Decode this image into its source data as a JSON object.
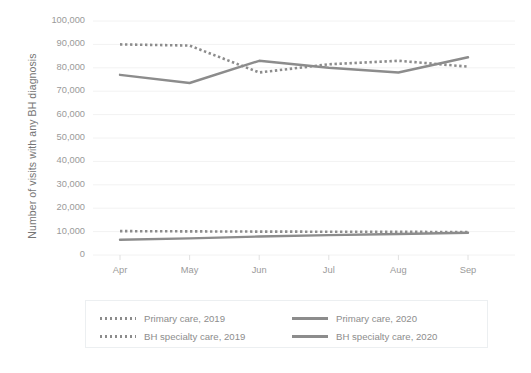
{
  "chart_data": {
    "type": "line",
    "title": "",
    "xlabel": "",
    "ylabel": "Number of visits with any BH diagnosis",
    "categories": [
      "Apr",
      "May",
      "Jun",
      "Jul",
      "Aug",
      "Sep"
    ],
    "ylim": [
      0,
      100000
    ],
    "y_ticks": [
      0,
      10000,
      20000,
      30000,
      40000,
      50000,
      60000,
      70000,
      80000,
      90000,
      100000
    ],
    "y_tick_labels": [
      "0",
      "10,000",
      "20,000",
      "30,000",
      "40,000",
      "50,000",
      "60,000",
      "70,000",
      "80,000",
      "90,000",
      "100,000"
    ],
    "grid": true,
    "grid_axis": "y",
    "legend_position": "bottom",
    "line_color": "#8c8c8c",
    "grid_color": "#f2f2f2",
    "series": [
      {
        "name": "Primary care, 2019",
        "style": "dotted",
        "color": "#8c8c8c",
        "values": [
          10200,
          10100,
          10000,
          9950,
          9900,
          9800
        ]
      },
      {
        "name": "BH specialty care, 2019",
        "style": "dotted",
        "color": "#8c8c8c",
        "values": [
          90000,
          89500,
          78000,
          81500,
          83000,
          80500
        ]
      },
      {
        "name": "Primary care, 2020",
        "style": "solid",
        "color": "#8c8c8c",
        "values": [
          6500,
          7100,
          7900,
          8500,
          9000,
          9500
        ]
      },
      {
        "name": "BH specialty care, 2020",
        "style": "solid",
        "color": "#8c8c8c",
        "values": [
          77000,
          73500,
          83000,
          80000,
          78000,
          84500
        ]
      }
    ]
  },
  "axis": {
    "y_title": "Number of visits with any BH diagnosis"
  },
  "legend": {
    "entries": [
      {
        "label": "Primary care, 2019",
        "style": "dotted"
      },
      {
        "label": "Primary care, 2020",
        "style": "solid"
      },
      {
        "label": "BH specialty care, 2019",
        "style": "dotted"
      },
      {
        "label": "BH specialty care, 2020",
        "style": "solid"
      }
    ]
  }
}
